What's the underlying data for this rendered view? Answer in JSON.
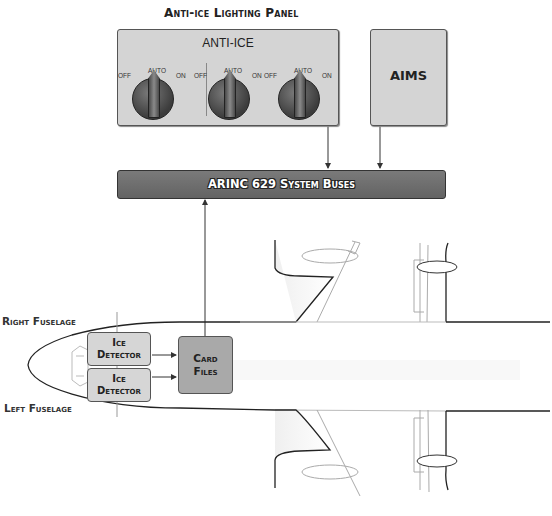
{
  "diagram": {
    "panel_title": "Anti-ice Lighting Panel",
    "panel": {
      "label": "ANTI-ICE",
      "knobs": [
        {
          "off": "OFF",
          "auto": "AUTO",
          "on": "ON"
        },
        {
          "off": "OFF",
          "auto": "AUTO",
          "on": "ON"
        },
        {
          "off": "OFF",
          "auto": "AUTO",
          "on": "ON"
        }
      ]
    },
    "aims_label": "AIMS",
    "bus_label": "ARINC 629 System Buses",
    "right_fuselage_label": "Right Fuselage",
    "left_fuselage_label": "Left Fuselage",
    "detectors": [
      {
        "line1": "Ice",
        "line2": "Detector"
      },
      {
        "line1": "Ice",
        "line2": "Detector"
      }
    ],
    "card_files": {
      "line1": "Card",
      "line2": "Files"
    },
    "colors": {
      "panel_bg": "#d4d4d4",
      "bus_bg": "#6e6e6e",
      "card_bg": "#a9a9a9",
      "outline": "#333333"
    }
  }
}
